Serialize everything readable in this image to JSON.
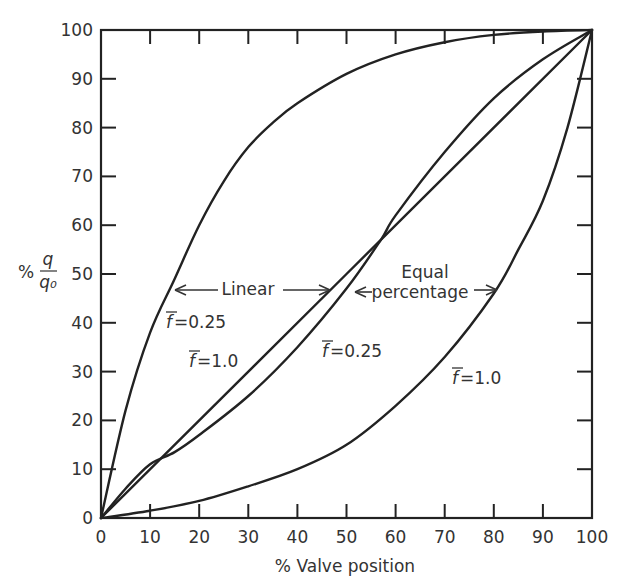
{
  "chart_data": {
    "type": "line",
    "title": "",
    "xlabel": "% Valve position",
    "ylabel": "% q/q0",
    "ylabel_parts": {
      "prefix": "%",
      "numerator": "q",
      "denominator": "q₀"
    },
    "xlim": [
      0,
      100
    ],
    "ylim": [
      0,
      100
    ],
    "grid": false,
    "legend": "none (inline annotations)",
    "x_ticks": [
      "0",
      "10",
      "20",
      "30",
      "40",
      "50",
      "60",
      "70",
      "80",
      "90",
      "100"
    ],
    "y_ticks": [
      "0",
      "10",
      "20",
      "30",
      "40",
      "50",
      "60",
      "70",
      "80",
      "90",
      "100"
    ],
    "series": [
      {
        "name": "Linear, f=0.25",
        "group": "Linear",
        "f": "0.25",
        "x": [
          0,
          5,
          10,
          15,
          20,
          25,
          30,
          35,
          40,
          50,
          60,
          70,
          80,
          90,
          100
        ],
        "y": [
          0,
          22,
          38,
          49,
          60,
          69,
          76,
          81,
          85,
          91,
          95,
          97.5,
          99,
          99.7,
          100
        ]
      },
      {
        "name": "Linear, f=1.0",
        "group": "Linear",
        "f": "1.0",
        "x": [
          0,
          100
        ],
        "y": [
          0,
          100
        ]
      },
      {
        "name": "Equal percentage, f=0.25",
        "group": "Equal percentage",
        "f": "0.25",
        "x": [
          0,
          5,
          10,
          15,
          20,
          30,
          40,
          50,
          57,
          60,
          70,
          80,
          90,
          100
        ],
        "y": [
          0,
          6,
          11,
          13.5,
          17,
          25,
          35,
          47,
          57,
          62,
          75,
          86,
          94,
          100
        ]
      },
      {
        "name": "Equal percentage, f=1.0",
        "group": "Equal percentage",
        "f": "1.0",
        "x": [
          0,
          10,
          20,
          30,
          40,
          50,
          60,
          70,
          80,
          85,
          90,
          95,
          100
        ],
        "y": [
          0,
          1.5,
          3.5,
          6.5,
          10,
          15,
          23,
          33,
          46,
          55,
          65,
          80,
          100
        ]
      }
    ],
    "annotations": [
      {
        "text": "Linear",
        "x": 30,
        "y": 47,
        "arrows_to": [
          "Linear, f=0.25",
          "Linear, f=1.0"
        ]
      },
      {
        "text": "Equal",
        "x": 63,
        "y": 51
      },
      {
        "text": "percentage",
        "x": 63,
        "y": 46,
        "arrows_to": [
          "Equal percentage, f=0.25",
          "Equal percentage, f=1.0"
        ]
      },
      {
        "text": "f=0.25",
        "x": 14,
        "y": 38,
        "series": "Linear, f=0.25"
      },
      {
        "text": "f=1.0",
        "x": 22,
        "y": 30,
        "series": "Linear, f=1.0"
      },
      {
        "text": "f=0.25",
        "x": 50,
        "y": 33,
        "series": "Equal percentage, f=0.25"
      },
      {
        "text": "f=1.0",
        "x": 75,
        "y": 24,
        "series": "Equal percentage, f=1.0"
      }
    ]
  },
  "labels": {
    "xlabel": "% Valve position",
    "ylabel_prefix": "%",
    "ylabel_num": "q",
    "ylabel_den": "q₀",
    "linear": "Linear",
    "equal": "Equal",
    "percentage": "percentage",
    "f_lin_025": "=0.25",
    "f_lin_10": "=1.0",
    "f_eq_025": "=0.25",
    "f_eq_10": "=1.0",
    "f_symbol": "f"
  }
}
